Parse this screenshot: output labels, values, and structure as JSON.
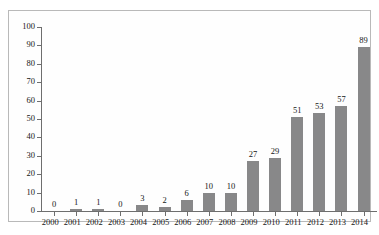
{
  "chart_data": {
    "type": "bar",
    "title": "",
    "subtitle": "",
    "xlabel": "",
    "ylabel": "",
    "categories": [
      "2000",
      "2001",
      "2002",
      "2003",
      "2004",
      "2005",
      "2006",
      "2007",
      "2008",
      "2009",
      "2010",
      "2011",
      "2012",
      "2013",
      "2014"
    ],
    "values": [
      0,
      1,
      1,
      0,
      3,
      2,
      6,
      10,
      10,
      27,
      29,
      51,
      53,
      57,
      89
    ],
    "data_labels": [
      "0",
      "1",
      "1",
      "0",
      "3",
      "2",
      "6",
      "10",
      "10",
      "27",
      "29",
      "51",
      "53",
      "57",
      "89"
    ],
    "ylim": [
      0,
      100
    ],
    "ytick_values": [
      0,
      10,
      20,
      30,
      40,
      50,
      60,
      70,
      80,
      90,
      100
    ],
    "ytick_labels": [
      "0",
      "10",
      "20",
      "30",
      "40",
      "50",
      "60",
      "70",
      "80",
      "90",
      "100"
    ],
    "grid": false,
    "legend": false,
    "legend_position": "none",
    "series": [
      {
        "name": "",
        "values": [
          0,
          1,
          1,
          0,
          3,
          2,
          6,
          10,
          10,
          27,
          29,
          51,
          53,
          57,
          89
        ]
      }
    ],
    "colors": {
      "bar": "#888889",
      "axis": "#6e6e6e",
      "frame": "#b9b9b9",
      "background": "#fefefe",
      "text": "#161616"
    }
  }
}
